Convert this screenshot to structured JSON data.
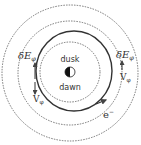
{
  "diagram": {
    "type": "orbit-schematic",
    "colors": {
      "background": "#ffffff",
      "line": "#444444",
      "text": "#333333"
    },
    "center_labels": {
      "top": "dusk",
      "bottom": "dawn"
    },
    "labels": {
      "efield_left": "δE",
      "efield_left_sub": "φ",
      "efield_right": "δE",
      "efield_right_sub": "φ",
      "velocity_left": "V",
      "velocity_left_sub": "φ",
      "velocity_right": "V",
      "velocity_right_sub": "φ",
      "electron": "e",
      "electron_sup": "−"
    },
    "circles": [
      {
        "name": "outer",
        "style": "dashed"
      },
      {
        "name": "middle",
        "style": "dashed"
      },
      {
        "name": "inner",
        "style": "dashed"
      }
    ],
    "orbit": {
      "style": "solid",
      "direction": "counter-clockwise"
    },
    "central_body": {
      "shading": "half-dark (left dark, right light)"
    }
  }
}
